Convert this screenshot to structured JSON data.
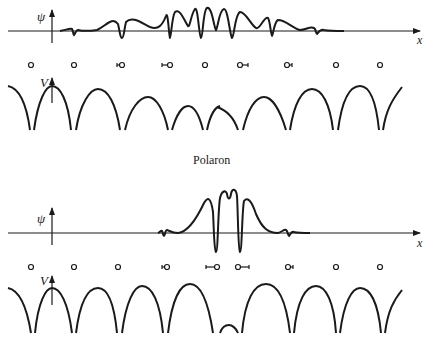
{
  "title": "Polaron",
  "panels": [
    {
      "id": "top",
      "wavefunction_axis_label": "ψ",
      "x_axis_label": "x",
      "potential_axis_label": "V",
      "ions": [
        "o",
        "o",
        "⊢o",
        "⊢o",
        "o",
        "o⊣",
        "o⊣",
        "o",
        "o"
      ],
      "description": "Extended electron wavefunction over undistorted lattice; slightly displaced ions and shallow potential wells"
    },
    {
      "id": "bottom",
      "wavefunction_axis_label": "ψ",
      "x_axis_label": "x",
      "potential_axis_label": "V",
      "ions": [
        "o",
        "o",
        "o",
        "⊢o",
        "⊢o",
        "o⊣",
        "o⊣",
        "o",
        "o"
      ],
      "description": "Localized polaron wavefunction with strongly displaced ions and deep central potential well"
    }
  ],
  "colors": {
    "ink": "#1a1a1a",
    "background": "#ffffff"
  }
}
